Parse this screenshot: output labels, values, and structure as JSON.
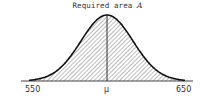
{
  "title": {
    "text": "Required area ",
    "symbol": "A"
  },
  "axis": {
    "ticks": [
      {
        "label": "550",
        "value": 550
      },
      {
        "label": "μ",
        "value": 600
      },
      {
        "label": "650",
        "value": 650
      }
    ]
  },
  "chart_data": {
    "type": "area",
    "title": "Required area A",
    "xlabel": "",
    "ylabel": "",
    "tick_labels": [
      "550",
      "μ",
      "650"
    ],
    "xlim": [
      550,
      650
    ],
    "mean_label": "μ",
    "shaded_region": [
      550,
      650
    ],
    "fill_pattern": "diagonal-hatch",
    "grid": false
  }
}
